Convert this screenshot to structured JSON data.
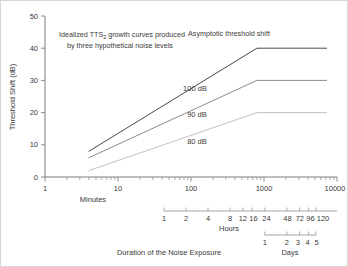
{
  "chart_data": {
    "type": "line",
    "title": "",
    "annotations": [
      {
        "name": "caption",
        "lines": [
          "Idealized TTS₂ growth curves produced",
          "by three hypothetical noise levels"
        ]
      },
      {
        "name": "asymptote-note",
        "text": "Asymptotic threshold shift"
      }
    ],
    "xlabel": "Minutes",
    "xlabel_secondary": "Hours",
    "xlabel_tertiary": "Days",
    "xtitle": "Duration of the Noise Exposure",
    "ylabel": "Threshold Shift (dB)",
    "xscale": "log",
    "xlim": [
      1,
      10000
    ],
    "ylim": [
      0,
      50
    ],
    "grid": false,
    "legend_position": "inline-labels",
    "xticks": [
      "1",
      "10",
      "100",
      "1000",
      "10000"
    ],
    "xtick_values": [
      1,
      10,
      100,
      1000,
      10000
    ],
    "yticks": [
      "0",
      "10",
      "20",
      "30",
      "40",
      "50"
    ],
    "ytick_values": [
      0,
      10,
      20,
      30,
      40,
      50
    ],
    "hours_axis": {
      "label": "Hours",
      "ticks": [
        "1",
        "2",
        "4",
        "8",
        "12",
        "16",
        "24",
        "48",
        "72",
        "96",
        "120"
      ],
      "tick_minutes": [
        60,
        120,
        240,
        480,
        720,
        960,
        1440,
        2880,
        4320,
        5760,
        7200
      ]
    },
    "days_axis": {
      "label": "Days",
      "ticks": [
        "1",
        "2",
        "3",
        "4",
        "5"
      ],
      "tick_minutes": [
        1440,
        2880,
        4320,
        5760,
        7200
      ]
    },
    "series": [
      {
        "name": "100 dB",
        "label": "100 dB",
        "color": "#4a4a4a",
        "asymptote_db": 40,
        "points": [
          [
            4,
            8
          ],
          [
            800,
            40
          ],
          [
            7200,
            40
          ]
        ]
      },
      {
        "name": "90 dB",
        "label": "90 dB",
        "color": "#8c8c8c",
        "asymptote_db": 30,
        "points": [
          [
            4,
            6
          ],
          [
            800,
            30
          ],
          [
            7200,
            30
          ]
        ]
      },
      {
        "name": "80 dB",
        "label": "80 dB",
        "color": "#c2c2c2",
        "asymptote_db": 20,
        "points": [
          [
            4,
            2
          ],
          [
            800,
            20
          ],
          [
            7200,
            20
          ]
        ]
      }
    ]
  },
  "labels": {
    "y_axis_title": "Threshold Shift (dB)",
    "x_axis_title": "Duration of the Noise Exposure",
    "minutes": "Minutes",
    "hours": "Hours",
    "days": "Days",
    "caption_line1": "Idealized TTS",
    "caption_sub": "2",
    "caption_line1b": " growth curves produced",
    "caption_line2": "by three hypothetical noise levels",
    "asymptotic": "Asymptotic threshold shift",
    "series_100": "100 dB",
    "series_90": "90 dB",
    "series_80": "80 dB",
    "y0": "0",
    "y10": "10",
    "y20": "20",
    "y30": "30",
    "y40": "40",
    "y50": "50",
    "x1": "1",
    "x10": "10",
    "x100": "100",
    "x1000": "1000",
    "x10000": "10000",
    "h1": "1",
    "h2": "2",
    "h4": "4",
    "h8": "8",
    "h12": "12",
    "h16": "16",
    "h24": "24",
    "h48": "48",
    "h72": "72",
    "h96": "96",
    "h120": "120",
    "d1": "1",
    "d2": "2",
    "d3": "3",
    "d4": "4",
    "d5": "5"
  },
  "colors": {
    "curve_100": "#4a4a4a",
    "curve_90": "#8c8c8c",
    "curve_80": "#c2c2c2",
    "axis": "#6e6e6e",
    "text": "#3a3a3a",
    "border": "#d8d8d8"
  }
}
